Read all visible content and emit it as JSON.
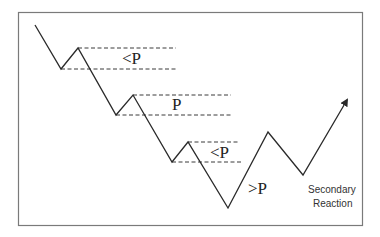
{
  "diagram": {
    "type": "price-action-schematic",
    "zones": [
      {
        "id": "pullback-1",
        "label": "<P"
      },
      {
        "id": "pullback-2",
        "label": "P"
      },
      {
        "id": "pullback-3",
        "label": "<P"
      }
    ],
    "rally_label": ">P",
    "secondary_reaction_label": [
      "Secondary",
      "Reaction"
    ],
    "colors": {
      "line": "#2a2a2a",
      "dashes": "#3a3a3a",
      "frame": "#7a7a7a",
      "background": "#ffffff"
    }
  }
}
